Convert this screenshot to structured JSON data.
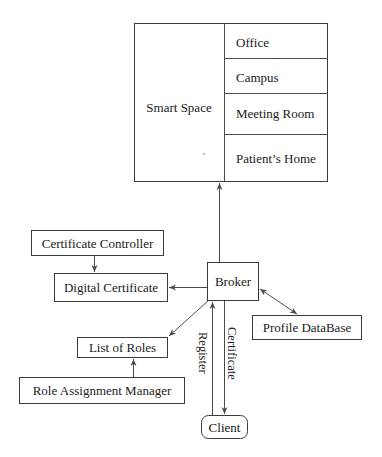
{
  "diagram": {
    "smart_space": {
      "label": "Smart Space",
      "locations": [
        "Office",
        "Campus",
        "Meeting Room",
        "Patient’s Home"
      ]
    },
    "nodes": {
      "certificate_controller": "Certificate Controller",
      "digital_certificate": "Digital Certificate",
      "broker": "Broker",
      "list_of_roles": "List of Roles",
      "role_assignment_manager": "Role Assignment Manager",
      "profile_database": "Profile DataBase",
      "client": "Client"
    },
    "edge_labels": {
      "register": "Register",
      "certificate": "Certificate"
    },
    "edges": [
      {
        "from": "Broker",
        "to": "Smart Space",
        "type": "directed"
      },
      {
        "from": "Certificate Controller",
        "to": "Digital Certificate",
        "type": "directed"
      },
      {
        "from": "Broker",
        "to": "Digital Certificate",
        "type": "directed"
      },
      {
        "from": "Broker",
        "to": "List of Roles",
        "type": "directed"
      },
      {
        "from": "Role Assignment Manager",
        "to": "List of Roles",
        "type": "directed"
      },
      {
        "from": "Broker",
        "to": "Profile DataBase",
        "type": "bidirectional"
      },
      {
        "from": "Client",
        "to": "Broker",
        "type": "directed",
        "label": "Register"
      },
      {
        "from": "Broker",
        "to": "Client",
        "type": "directed",
        "label": "Certificate"
      }
    ]
  }
}
